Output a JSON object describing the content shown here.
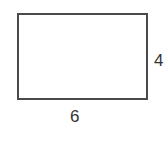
{
  "diagram": {
    "shape": "rectangle",
    "width_label": "6",
    "height_label": "4",
    "stroke_color": "#4a4a4a"
  }
}
